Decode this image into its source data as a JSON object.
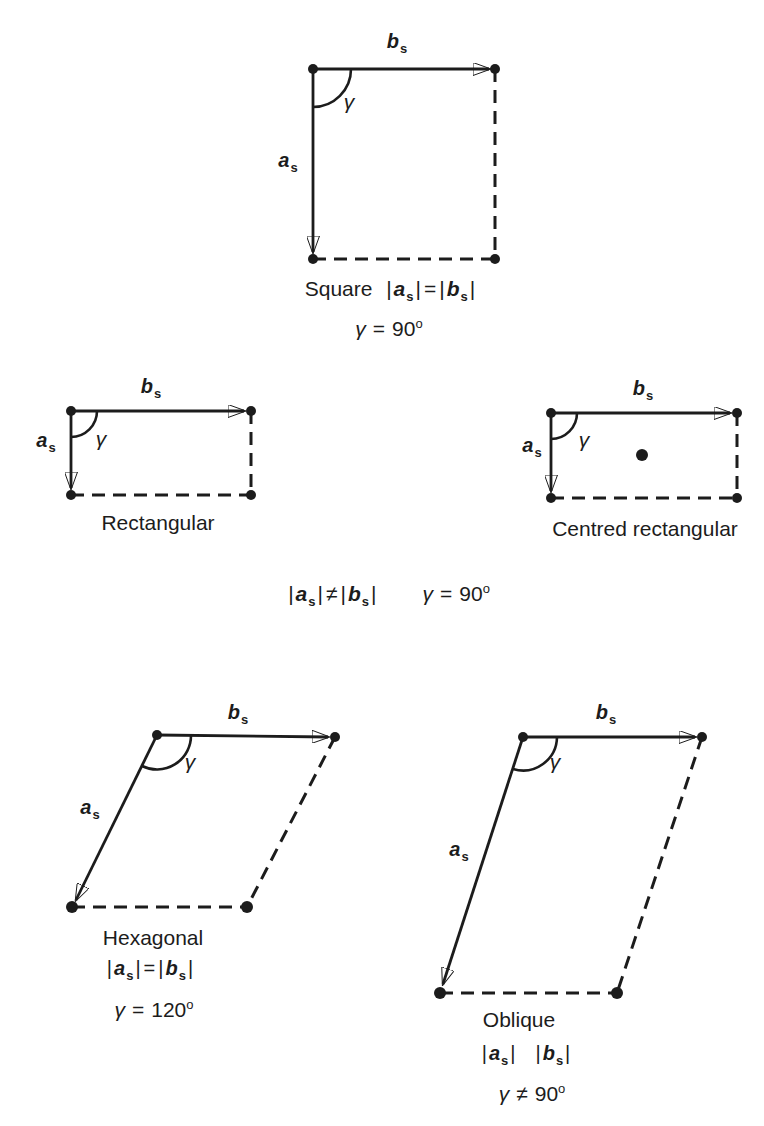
{
  "page": {
    "background": "#ffffff",
    "ink": "#1c1c1c"
  },
  "symbols": {
    "vector_a": "a",
    "vector_b": "b",
    "subscript": "s",
    "gamma": "γ",
    "bar": "|",
    "degree": "o"
  },
  "diagrams": {
    "square": {
      "label": "Square",
      "norm_relation": "=",
      "gamma_relation": "=",
      "gamma_value": "90"
    },
    "rectangular": {
      "label": "Rectangular"
    },
    "centred_rectangular": {
      "label": "Centred rectangular"
    },
    "rectangular_shared": {
      "norm_relation": "≠",
      "gamma_relation": "=",
      "gamma_value": "90"
    },
    "hexagonal": {
      "label": "Hexagonal",
      "norm_relation": "=",
      "gamma_relation": "=",
      "gamma_value": "120"
    },
    "oblique": {
      "label": "Oblique",
      "norm_relation": "",
      "gamma_relation": "≠",
      "gamma_value": "90"
    }
  }
}
